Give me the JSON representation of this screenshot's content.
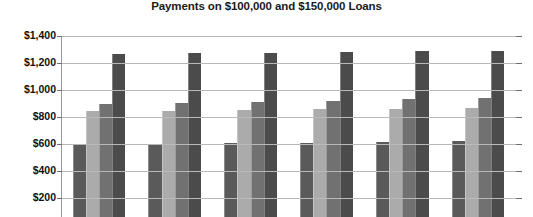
{
  "chart_data": {
    "type": "bar",
    "title": "Payments on $100,000 and $150,000 Loans",
    "xlabel": "",
    "ylabel": "",
    "ylim": [
      200,
      1400
    ],
    "ytick_step": 200,
    "ytick_labels": [
      "$1,400",
      "$1,200",
      "$1,000",
      "$800",
      "$600",
      "$400",
      "$200"
    ],
    "ytick_values": [
      1400,
      1200,
      1000,
      800,
      600,
      400,
      200
    ],
    "grid": true,
    "legend": "none",
    "categories": [
      "1",
      "2",
      "3",
      "4",
      "5",
      "6"
    ],
    "series": [
      {
        "name": "Series 1",
        "color": "#5a5a5a",
        "values": [
          600,
          602,
          605,
          610,
          615,
          620
        ]
      },
      {
        "name": "Series 2",
        "color": "#ababab",
        "values": [
          845,
          848,
          853,
          857,
          860,
          865
        ]
      },
      {
        "name": "Series 3",
        "color": "#717171",
        "values": [
          895,
          905,
          912,
          920,
          930,
          938
        ]
      },
      {
        "name": "Series 4",
        "color": "#4b4b4b",
        "values": [
          1265,
          1272,
          1275,
          1282,
          1290,
          1292
        ]
      }
    ],
    "note": "Chart is cropped at the bottom; x-axis category labels are not visible in the screenshot."
  }
}
